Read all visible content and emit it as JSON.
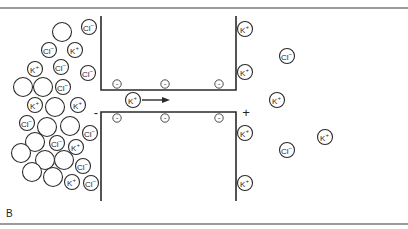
{
  "figure": {
    "panel_label": "B",
    "colors": {
      "line": "#2a2a2a",
      "border": "#7a7a7a",
      "background": "#ffffff"
    }
  },
  "labels": {
    "cl": "Cl",
    "cl_sup": "−",
    "k": "K",
    "k_sup": "+",
    "minus_charge": "-",
    "left_sign": "-",
    "right_sign": "+"
  },
  "left_side": {
    "empty_circles": [
      {
        "x": 62,
        "y": 32
      },
      {
        "x": 23,
        "y": 87
      },
      {
        "x": 43,
        "y": 87
      },
      {
        "x": 55,
        "y": 107
      },
      {
        "x": 47,
        "y": 127
      },
      {
        "x": 70,
        "y": 126
      },
      {
        "x": 35,
        "y": 142
      },
      {
        "x": 21,
        "y": 153
      },
      {
        "x": 45,
        "y": 160
      },
      {
        "x": 64,
        "y": 160
      },
      {
        "x": 32,
        "y": 172
      },
      {
        "x": 53,
        "y": 177
      }
    ],
    "ions": [
      {
        "type": "Cl",
        "x": 89,
        "y": 27
      },
      {
        "type": "Cl",
        "x": 49,
        "y": 50
      },
      {
        "type": "K",
        "x": 75,
        "y": 50
      },
      {
        "type": "K",
        "x": 35,
        "y": 69
      },
      {
        "type": "Cl",
        "x": 61,
        "y": 67
      },
      {
        "type": "Cl",
        "x": 88,
        "y": 73
      },
      {
        "type": "Cl",
        "x": 63,
        "y": 87
      },
      {
        "type": "K",
        "x": 35,
        "y": 105
      },
      {
        "type": "K",
        "x": 78,
        "y": 105
      },
      {
        "type": "Cl",
        "x": 27,
        "y": 123
      },
      {
        "type": "Cl",
        "x": 90,
        "y": 133
      },
      {
        "type": "Cl",
        "x": 57,
        "y": 143
      },
      {
        "type": "K",
        "x": 76,
        "y": 147
      },
      {
        "type": "Cl",
        "x": 83,
        "y": 166
      },
      {
        "type": "K",
        "x": 72,
        "y": 182
      },
      {
        "type": "Cl",
        "x": 91,
        "y": 183
      }
    ]
  },
  "channel": {
    "left_x": 101,
    "right_x": 236,
    "upper_top": 16,
    "upper_bottom": 90,
    "lower_top": 112,
    "lower_bottom": 201,
    "upper_charges": [
      {
        "x": 117,
        "y": 84
      },
      {
        "x": 165,
        "y": 84
      },
      {
        "x": 219,
        "y": 84
      }
    ],
    "lower_charges": [
      {
        "x": 117,
        "y": 118
      },
      {
        "x": 165,
        "y": 118
      },
      {
        "x": 219,
        "y": 118
      }
    ],
    "moving_ion": {
      "type": "K",
      "x": 133,
      "y": 100
    },
    "arrow": {
      "x1": 142,
      "y1": 100,
      "x2": 170,
      "y2": 100
    },
    "left_sign_pos": {
      "x": 96,
      "y": 112
    },
    "right_sign_pos": {
      "x": 246,
      "y": 112
    }
  },
  "right_side": {
    "ions": [
      {
        "type": "K",
        "x": 245,
        "y": 29
      },
      {
        "type": "K",
        "x": 245,
        "y": 72
      },
      {
        "type": "K",
        "x": 245,
        "y": 133
      },
      {
        "type": "K",
        "x": 245,
        "y": 183
      },
      {
        "type": "Cl",
        "x": 287,
        "y": 56
      },
      {
        "type": "K",
        "x": 277,
        "y": 100
      },
      {
        "type": "Cl",
        "x": 287,
        "y": 150
      },
      {
        "type": "K",
        "x": 325,
        "y": 137
      }
    ]
  }
}
